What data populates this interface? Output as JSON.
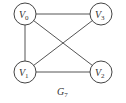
{
  "graph": {
    "caption": {
      "main": "G",
      "sub": "7"
    },
    "nodes": [
      {
        "id": "V0",
        "main": "V",
        "sub": "0",
        "x": 25,
        "y": 14
      },
      {
        "id": "V3",
        "main": "V",
        "sub": "3",
        "x": 101,
        "y": 14
      },
      {
        "id": "V1",
        "main": "V",
        "sub": "1",
        "x": 25,
        "y": 72
      },
      {
        "id": "V2",
        "main": "V",
        "sub": "2",
        "x": 101,
        "y": 72
      }
    ],
    "edges": [
      [
        "V0",
        "V3"
      ],
      [
        "V0",
        "V1"
      ],
      [
        "V0",
        "V2"
      ],
      [
        "V1",
        "V3"
      ],
      [
        "V1",
        "V2"
      ]
    ]
  }
}
